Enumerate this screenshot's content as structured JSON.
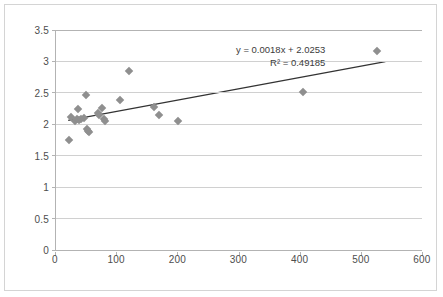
{
  "chart_data": {
    "type": "scatter",
    "title": "",
    "xlabel": "",
    "ylabel": "",
    "xlim": [
      0,
      600
    ],
    "ylim": [
      0,
      3.5
    ],
    "xticks": [
      0,
      100,
      200,
      300,
      400,
      500,
      600
    ],
    "yticks": [
      0,
      0.5,
      1,
      1.5,
      2,
      2.5,
      3,
      3.5
    ],
    "xtick_labels": [
      "0",
      "100",
      "200",
      "300",
      "400",
      "500",
      "600"
    ],
    "ytick_labels": [
      "0",
      "0.5",
      "1",
      "1.5",
      "2",
      "2.5",
      "3",
      "3.5"
    ],
    "grid": "horizontal",
    "legend": "none",
    "marker_style": "diamond",
    "marker_color": "#8f8f8f",
    "trendline_color": "#333333",
    "gridline_color": "#d0d0d0",
    "axis_color": "#b3b3b3",
    "points": [
      {
        "x": 22,
        "y": 1.75
      },
      {
        "x": 25,
        "y": 2.11
      },
      {
        "x": 31,
        "y": 2.06
      },
      {
        "x": 34,
        "y": 2.08
      },
      {
        "x": 36,
        "y": 2.25
      },
      {
        "x": 37,
        "y": 2.07
      },
      {
        "x": 41,
        "y": 2.09
      },
      {
        "x": 46,
        "y": 2.1
      },
      {
        "x": 49,
        "y": 2.46
      },
      {
        "x": 50,
        "y": 1.92
      },
      {
        "x": 52,
        "y": 1.9
      },
      {
        "x": 54,
        "y": 1.87
      },
      {
        "x": 68,
        "y": 2.18
      },
      {
        "x": 70,
        "y": 2.15
      },
      {
        "x": 76,
        "y": 2.26
      },
      {
        "x": 78,
        "y": 2.09
      },
      {
        "x": 80,
        "y": 2.05
      },
      {
        "x": 105,
        "y": 2.38
      },
      {
        "x": 119,
        "y": 2.85
      },
      {
        "x": 160,
        "y": 2.27
      },
      {
        "x": 168,
        "y": 2.15
      },
      {
        "x": 200,
        "y": 2.05
      },
      {
        "x": 403,
        "y": 2.51
      },
      {
        "x": 525,
        "y": 3.17
      }
    ],
    "trendline": {
      "slope": 0.0018,
      "intercept": 2.0253,
      "x_start": 20,
      "x_end": 540
    },
    "annotations": {
      "equation": "y = 0.0018x + 2.0253",
      "r_squared": "R² = 0.49185"
    }
  }
}
